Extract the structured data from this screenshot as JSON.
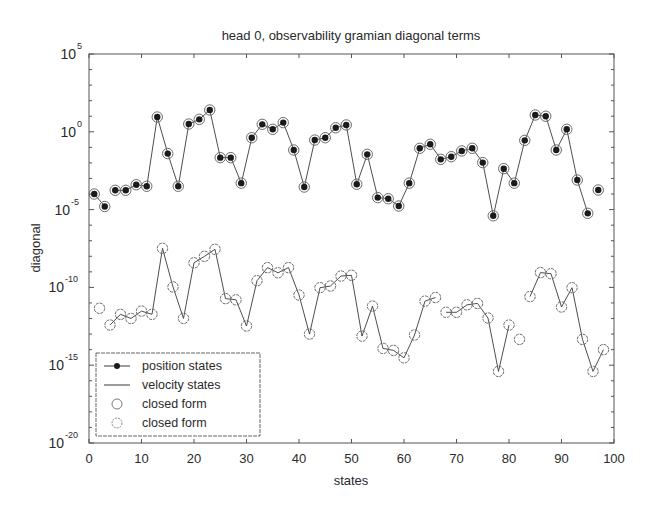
{
  "chart_data": {
    "type": "line",
    "title": "head 0, observability gramian diagonal terms",
    "xlabel": "states",
    "ylabel": "diagonal",
    "xscale": "linear",
    "yscale": "log",
    "xlim": [
      0,
      100
    ],
    "ylim_exponent": [
      -20,
      5
    ],
    "x_ticks": [
      0,
      10,
      20,
      30,
      40,
      50,
      60,
      70,
      80,
      90,
      100
    ],
    "y_ticks": [
      {
        "base": "10",
        "exp": "5",
        "value_exp": 5
      },
      {
        "base": "10",
        "exp": "0",
        "value_exp": 0
      },
      {
        "base": "10",
        "exp": "-5",
        "value_exp": -5
      },
      {
        "base": "10",
        "exp": "-10",
        "value_exp": -10
      },
      {
        "base": "10",
        "exp": "-15",
        "value_exp": -15
      },
      {
        "base": "10",
        "exp": "-20",
        "value_exp": -20
      }
    ],
    "grid": false,
    "legend_position": "lower left",
    "legend": [
      {
        "label": "position states",
        "marker": "filled-dot-line"
      },
      {
        "label": "velocity states",
        "marker": "line"
      },
      {
        "label": "closed form",
        "marker": "open-circle"
      },
      {
        "label": "closed form",
        "marker": "open-circle"
      }
    ],
    "series": [
      {
        "name": "position states",
        "value_format": "log10",
        "x": [
          1,
          3,
          5,
          7,
          9,
          11,
          13,
          15,
          17,
          19,
          21,
          23,
          25,
          27,
          29,
          31,
          33,
          35,
          37,
          39,
          41,
          43,
          45,
          47,
          49,
          51,
          53,
          55,
          57,
          59,
          61,
          63,
          65,
          67,
          69,
          71,
          73,
          75,
          77,
          79,
          81,
          83,
          85,
          87,
          89,
          91,
          93,
          95,
          97
        ],
        "log10_values": [
          -4.0,
          -4.8,
          -3.76,
          -3.76,
          -3.4,
          -3.5,
          0.95,
          -1.4,
          -3.5,
          0.5,
          0.8,
          1.4,
          -1.66,
          -1.66,
          -3.3,
          -0.38,
          0.48,
          0.16,
          0.59,
          -1.17,
          -3.55,
          -0.53,
          -0.38,
          0.26,
          0.44,
          -3.37,
          -1.45,
          -4.23,
          -4.3,
          -4.77,
          -3.3,
          -1.06,
          -0.8,
          -1.77,
          -1.6,
          -1.23,
          -1.06,
          -1.98,
          -5.4,
          -2.37,
          -3.3,
          -0.55,
          1.08,
          1.0,
          -1.17,
          0.16,
          -3.1,
          -5.24,
          -3.74
        ],
        "line_segments": [
          [
            0,
            1
          ],
          [
            2,
            47
          ]
        ]
      },
      {
        "name": "velocity states",
        "value_format": "log10",
        "x": [
          2,
          4,
          6,
          8,
          10,
          12,
          14,
          16,
          18,
          20,
          22,
          24,
          26,
          28,
          30,
          32,
          34,
          36,
          38,
          40,
          42,
          44,
          46,
          48,
          50,
          52,
          54,
          56,
          58,
          60,
          62,
          64,
          66,
          68,
          70,
          72,
          74,
          76,
          78,
          80,
          82,
          84,
          86,
          88,
          90,
          92,
          94,
          96,
          98
        ],
        "log10_values": [
          -11.34,
          -12.42,
          -11.73,
          -12.0,
          -11.52,
          -11.73,
          -7.49,
          -9.97,
          -11.99,
          -8.42,
          -8.0,
          -7.55,
          -10.72,
          -10.8,
          -12.48,
          -9.57,
          -8.73,
          -9.06,
          -8.73,
          -10.49,
          -13.0,
          -10.02,
          -9.91,
          -9.27,
          -9.22,
          -13.13,
          -11.2,
          -13.92,
          -14.05,
          -14.53,
          -13.06,
          -10.88,
          -10.65,
          -11.6,
          -11.6,
          -11.12,
          -11.03,
          -11.97,
          -15.4,
          -12.42,
          -13.34,
          -10.59,
          -9.05,
          -9.12,
          -11.26,
          -10.02,
          -13.34,
          -15.4,
          -14.0
        ],
        "line_segments": [
          [
            1,
            32
          ],
          [
            33,
            39
          ],
          [
            41,
            48
          ]
        ]
      }
    ]
  },
  "colors": {
    "line": "#3a3a3a",
    "marker_fill": "#1a1a1a",
    "circle": "#6a6a6a",
    "axis": "#555555",
    "text": "#2a2a2a"
  }
}
